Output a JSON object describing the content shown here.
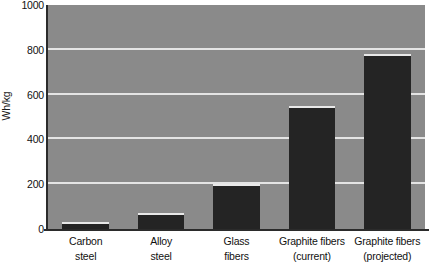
{
  "chart_data": {
    "type": "bar",
    "title": "",
    "xlabel": "",
    "ylabel": "Wh/kg",
    "ylim": [
      0,
      1000
    ],
    "grid": true,
    "legend": "none",
    "yticks": [
      1000,
      800,
      600,
      400,
      200,
      0
    ],
    "ytick_labels": [
      "1000",
      "800",
      "600",
      "400",
      "200",
      "0"
    ],
    "categories": [
      "Carbon steel",
      "Alloy steel",
      "Glass fibers",
      "Graphite fibers (current)",
      "Graphite fibers (projected)"
    ],
    "category_lines": [
      [
        "Carbon",
        "steel"
      ],
      [
        "Alloy",
        "steel"
      ],
      [
        "Glass",
        "fibers"
      ],
      [
        "Graphite fibers",
        "(current)"
      ],
      [
        "Graphite fibers",
        "(projected)"
      ]
    ],
    "values": [
      30,
      70,
      200,
      550,
      780
    ],
    "colors": {
      "bar_fill": "#242424",
      "bar_highlight": "#e8e8e8",
      "plot_background": "#8a8a8a",
      "gridline": "#e4e4e4",
      "axis": "#2b2b2b",
      "page_background": "#ffffff",
      "text": "#111111"
    }
  }
}
